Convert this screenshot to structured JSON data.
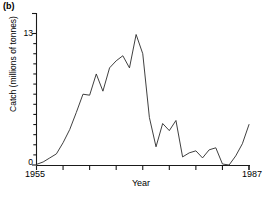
{
  "panel": {
    "label": "(b)"
  },
  "axes": {
    "ylabel": "Catch (millions of tonnes)",
    "xlabel": "Year",
    "ytick_top": "13",
    "ytick_zero": "0",
    "xtick_start": "1955",
    "xtick_end": "1987"
  },
  "style": {
    "line_color": "#2a2a2a",
    "axis_color": "#1a1a1a",
    "background": "#ffffff"
  },
  "chart_data": {
    "type": "line",
    "title": "(b)",
    "xlabel": "Year",
    "ylabel": "Catch (millions of tonnes)",
    "xlim": [
      1955,
      1987
    ],
    "ylim": [
      0,
      13.9
    ],
    "grid": false,
    "legend": "none",
    "x_tick_labels": [
      "1955",
      "1987"
    ],
    "y_tick_labels": [
      "0",
      "13"
    ],
    "x_minor_tick_interval": 4,
    "y_minor_tick_interval": 1,
    "x": [
      1955,
      1956,
      1957,
      1958,
      1959,
      1960,
      1961,
      1962,
      1963,
      1964,
      1965,
      1966,
      1967,
      1968,
      1969,
      1970,
      1971,
      1972,
      1973,
      1974,
      1975,
      1976,
      1977,
      1978,
      1979,
      1980,
      1981,
      1982,
      1983,
      1984,
      1985,
      1986,
      1987
    ],
    "series": [
      {
        "name": "Catch",
        "values": [
          0.06,
          0.3,
          0.7,
          1.1,
          2.2,
          3.5,
          5.2,
          7.0,
          6.9,
          9.0,
          7.3,
          9.6,
          10.3,
          10.8,
          9.6,
          12.9,
          11.0,
          4.7,
          1.8,
          4.1,
          3.4,
          4.4,
          0.8,
          1.2,
          1.4,
          0.7,
          1.5,
          1.7,
          0.1,
          0.0,
          0.9,
          2.1,
          4.0
        ]
      }
    ],
    "annotations": {
      "peak_year": 1970,
      "peak_value": 12.9,
      "collapse_year": 1984,
      "collapse_value": 0.0
    }
  }
}
